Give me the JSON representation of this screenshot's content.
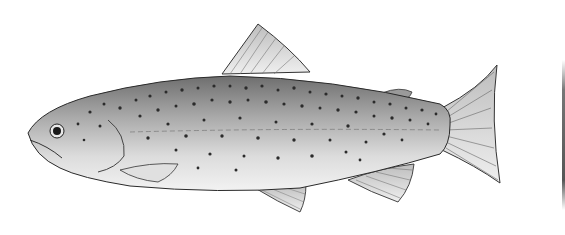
{
  "illustration": {
    "subject": "trout fish",
    "style": "grayscale pencil drawing",
    "facing": "left",
    "colors": {
      "background": "#ffffff",
      "outline": "#2a2a2a",
      "body_dark": "#8a8a8a",
      "body_light": "#e6e6e6",
      "spots": "#2b2b2b"
    }
  }
}
